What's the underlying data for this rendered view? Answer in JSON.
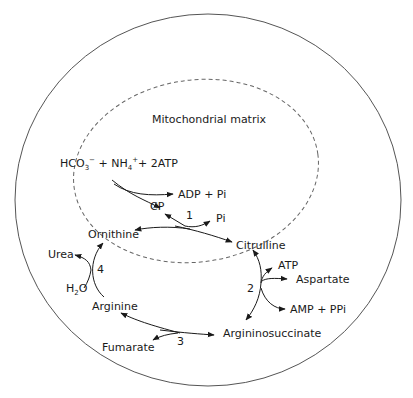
{
  "diagram": {
    "compartment_label": "Mitochondrial matrix",
    "substrates": {
      "hco3": "HCO",
      "hco3_sub": "3",
      "hco3_sup": "−",
      "plus1": " + NH",
      "nh4_sub": "4",
      "nh4_sup": "+",
      "plus2": "+ 2ATP"
    },
    "nodes": {
      "adp_pi": "ADP + Pi",
      "cp": "CP",
      "pi": "Pi",
      "ornithine": "Ornithine",
      "citrulline": "Citrulline",
      "atp": "ATP",
      "aspartate": "Aspartate",
      "amp_ppi": "AMP + PPi",
      "argininosuccinate": "Argininosuccinate",
      "fumarate": "Fumarate",
      "arginine": "Arginine",
      "urea": "Urea",
      "water": "H",
      "water_sub": "2",
      "water_o": "O"
    },
    "reaction_numbers": {
      "r1": "1",
      "r2": "2",
      "r3": "3",
      "r4": "4"
    },
    "colors": {
      "line": "#1a1a1a",
      "outer_circle": "#555555",
      "dashed": "#666666"
    }
  }
}
